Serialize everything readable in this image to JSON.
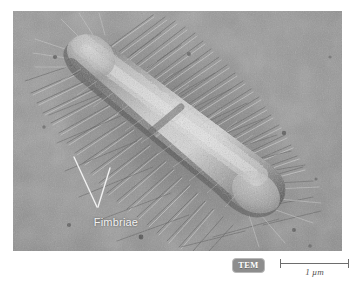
{
  "figure": {
    "type": "electron-micrograph",
    "background_color": "#ffffff"
  },
  "micrograph": {
    "name": "tem-micrograph",
    "base_gray": "#8e8e8e",
    "annotation": {
      "label": "Fimbriae",
      "label_color": "#f2f2f2",
      "leader_color": "#f0f0f0"
    }
  },
  "caption": {
    "technique_badge": {
      "label": "TEM",
      "background_color": "#8d8d8d",
      "text_color": "#ffffff"
    },
    "scale_bar": {
      "label": "1 µm",
      "line_color": "#6d6d6d",
      "length_px": 69
    }
  }
}
